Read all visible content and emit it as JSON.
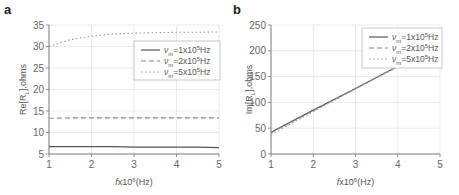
{
  "chart_data": [
    {
      "type": "line",
      "panel_label": "a",
      "title": "",
      "xlabel": "fx10^6(Hz)",
      "xlabel_parts": {
        "pre": "fx10",
        "sup": "6",
        "post": "(Hz)"
      },
      "ylabel": "Re[R_L],ohms",
      "ylabel_parts": {
        "pre": "Re[R",
        "sub": "L",
        "post": "],ohms"
      },
      "xlim": [
        1,
        5
      ],
      "ylim": [
        5,
        35
      ],
      "xticks": [
        "1",
        "2",
        "3",
        "4",
        "5"
      ],
      "yticks": [
        "5",
        "10",
        "15",
        "20",
        "25",
        "30",
        "35"
      ],
      "grid": true,
      "legend_position": "upper right",
      "x": [
        1,
        1.5,
        2,
        2.5,
        3,
        3.5,
        4,
        4.5,
        5
      ],
      "series": [
        {
          "name": "νm=1x10^5Hz",
          "legend": {
            "sym": "ν",
            "sub": "m",
            "pre": "=1x10",
            "sup": "5",
            "post": "Hz"
          },
          "style": "solid",
          "color": "#555555",
          "values": [
            6.7,
            6.7,
            6.7,
            6.7,
            6.6,
            6.6,
            6.6,
            6.6,
            6.5
          ]
        },
        {
          "name": "νm=2x10^5Hz",
          "legend": {
            "sym": "ν",
            "sub": "m",
            "pre": "=2x10",
            "sup": "5",
            "post": "Hz"
          },
          "style": "dashed",
          "color": "#888888",
          "values": [
            13.3,
            13.4,
            13.4,
            13.4,
            13.4,
            13.4,
            13.4,
            13.4,
            13.4
          ]
        },
        {
          "name": "νm=5x10^5Hz",
          "legend": {
            "sym": "ν",
            "sub": "m",
            "pre": "=5x10",
            "sup": "5",
            "post": "Hz"
          },
          "style": "dotted",
          "color": "#999999",
          "values": [
            30.0,
            31.6,
            32.4,
            32.9,
            33.1,
            33.2,
            33.3,
            33.3,
            33.4
          ]
        }
      ]
    },
    {
      "type": "line",
      "panel_label": "b",
      "title": "",
      "xlabel": "fx10^6(Hz)",
      "xlabel_parts": {
        "pre": "fx10",
        "sup": "6",
        "post": "(Hz)"
      },
      "ylabel": "Im[R_L],ohms",
      "ylabel_parts": {
        "pre": "Im[R",
        "sub": "L",
        "post": "],ohms"
      },
      "xlim": [
        1,
        5
      ],
      "ylim": [
        0,
        250
      ],
      "xticks": [
        "1",
        "2",
        "3",
        "4",
        "5"
      ],
      "yticks": [
        "0",
        "50",
        "100",
        "150",
        "200",
        "250"
      ],
      "grid": true,
      "legend_position": "upper right",
      "x": [
        1,
        2,
        3,
        4,
        5
      ],
      "series": [
        {
          "name": "νm=1x10^5Hz",
          "legend": {
            "sym": "ν",
            "sub": "m",
            "pre": "=1x10",
            "sup": "5",
            "post": "Hz"
          },
          "style": "solid",
          "color": "#555555",
          "values": [
            42,
            85,
            127,
            170,
            212
          ]
        },
        {
          "name": "νm=2x10^5Hz",
          "legend": {
            "sym": "ν",
            "sub": "m",
            "pre": "=2x10",
            "sup": "5",
            "post": "Hz"
          },
          "style": "dashed",
          "color": "#888888",
          "values": [
            41,
            84,
            127,
            170,
            212
          ]
        },
        {
          "name": "νm=5x10^5Hz",
          "legend": {
            "sym": "ν",
            "sub": "m",
            "pre": "=5x10",
            "sup": "5",
            "post": "Hz"
          },
          "style": "dotted",
          "color": "#999999",
          "values": [
            38,
            82,
            126,
            169,
            212
          ]
        }
      ]
    }
  ]
}
